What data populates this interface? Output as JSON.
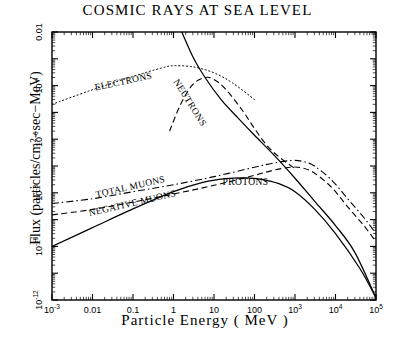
{
  "chart_data": {
    "type": "line",
    "title": "COSMIC  RAYS  AT  SEA  LEVEL",
    "xlabel": "Particle   Energy   ( MeV )",
    "ylabel": "Flux  (particles/cm²−sec−MeV)",
    "xscale": "log",
    "yscale": "log",
    "xlim": [
      0.001,
      100000
    ],
    "ylim": [
      1e-12,
      0.01
    ],
    "grid": false,
    "legend": "inline-curve-labels",
    "xticks": [
      {
        "value": 0.001,
        "label": "10",
        "sup": "-3"
      },
      {
        "value": 0.01,
        "label": "0.01",
        "sup": ""
      },
      {
        "value": 0.1,
        "label": "0.1",
        "sup": ""
      },
      {
        "value": 1,
        "label": "1",
        "sup": ""
      },
      {
        "value": 10,
        "label": "10",
        "sup": ""
      },
      {
        "value": 100,
        "label": "100",
        "sup": ""
      },
      {
        "value": 1000,
        "label": "10",
        "sup": "3"
      },
      {
        "value": 10000,
        "label": "10",
        "sup": "4"
      },
      {
        "value": 100000,
        "label": "10",
        "sup": "5"
      }
    ],
    "yticks": [
      {
        "value": 0.01,
        "label": "0.01",
        "sup": ""
      },
      {
        "value": 0.0001,
        "label": "10",
        "sup": "-4"
      },
      {
        "value": 1e-06,
        "label": "10",
        "sup": "-6"
      },
      {
        "value": 1e-08,
        "label": "10",
        "sup": "-8"
      },
      {
        "value": 1e-10,
        "label": "10",
        "sup": "-10"
      },
      {
        "value": 1e-12,
        "label": "10",
        "sup": "-12"
      }
    ],
    "series": [
      {
        "name": "ELECTRONS",
        "style": "dotted",
        "label": "ELECTRONS",
        "label_x": 0.06,
        "label_y": 0.00011,
        "label_rotate": -12,
        "points": [
          [
            0.001,
            2e-05
          ],
          [
            0.01,
            7e-05
          ],
          [
            0.1,
            0.00022
          ],
          [
            0.5,
            0.00045
          ],
          [
            1.0,
            0.00055
          ],
          [
            3.0,
            0.0005
          ],
          [
            10,
            0.0003
          ],
          [
            30,
            0.00012
          ],
          [
            100,
            3e-05
          ]
        ]
      },
      {
        "name": "NEUTRONS",
        "style": "dashed",
        "label": "NEUTRONS",
        "label_x": 2.2,
        "label_y": 2e-05,
        "label_rotate": 58,
        "points": [
          [
            0.8,
            2e-06
          ],
          [
            1.5,
            2e-05
          ],
          [
            3.0,
            0.00011
          ],
          [
            6.0,
            0.0002
          ],
          [
            10,
            0.00017
          ],
          [
            20,
            7e-05
          ],
          [
            50,
            1.2e-05
          ],
          [
            100,
            2.5e-06
          ],
          [
            200,
            6e-07
          ],
          [
            400,
            2.2e-07
          ],
          [
            1000,
            8e-08
          ]
        ]
      },
      {
        "name": "TOTAL MUONS",
        "style": "dash-dot",
        "label": "TOTAL MUONS",
        "label_x": 0.09,
        "label_y": 1.3e-08,
        "label_rotate": -13,
        "points": [
          [
            0.001,
            4e-09
          ],
          [
            0.01,
            6e-09
          ],
          [
            0.1,
            1.1e-08
          ],
          [
            1,
            2e-08
          ],
          [
            10,
            4e-08
          ],
          [
            100,
            9e-08
          ],
          [
            300,
            1.3e-07
          ],
          [
            800,
            1.6e-07
          ],
          [
            1500,
            1.5e-07
          ],
          [
            3000,
            1e-07
          ],
          [
            8000,
            3e-08
          ],
          [
            20000,
            6e-09
          ],
          [
            50000,
            1.2e-09
          ],
          [
            100000,
            3e-10
          ]
        ]
      },
      {
        "name": "NEGATIVE MUONS",
        "style": "dashed",
        "label": "NEGATIVE MUONS",
        "label_x": 0.1,
        "label_y": 3.2e-09,
        "label_rotate": -13,
        "points": [
          [
            0.001,
            1.5e-09
          ],
          [
            0.01,
            2.4e-09
          ],
          [
            0.1,
            4.5e-09
          ],
          [
            1,
            9e-09
          ],
          [
            10,
            1.9e-08
          ],
          [
            100,
            4.5e-08
          ],
          [
            300,
            7e-08
          ],
          [
            800,
            9e-08
          ],
          [
            1500,
            8.5e-08
          ],
          [
            3000,
            5.5e-08
          ],
          [
            8000,
            1.6e-08
          ],
          [
            20000,
            3e-09
          ],
          [
            50000,
            6e-10
          ],
          [
            100000,
            1.5e-10
          ]
        ]
      },
      {
        "name": "PROTONS",
        "style": "solid",
        "label": "PROTONS",
        "label_x": 60,
        "label_y": 2e-08,
        "label_rotate": 0,
        "points": [
          [
            0.001,
            1e-10
          ],
          [
            0.01,
            5e-10
          ],
          [
            0.1,
            2.5e-09
          ],
          [
            1,
            1.1e-08
          ],
          [
            5,
            2.4e-08
          ],
          [
            20,
            3.4e-08
          ],
          [
            60,
            3.6e-08
          ],
          [
            150,
            3.2e-08
          ],
          [
            400,
            2.2e-08
          ],
          [
            1000,
            1.1e-08
          ],
          [
            3000,
            2.5e-09
          ],
          [
            10000,
            3e-10
          ],
          [
            40000,
            1.5e-11
          ],
          [
            100000,
            1.2e-12
          ]
        ]
      },
      {
        "name": "PRIMARY-SPECTRUM",
        "style": "solid",
        "label": "",
        "label_x": 0,
        "label_y": 0,
        "label_rotate": 0,
        "points": [
          [
            1.6,
            0.01
          ],
          [
            3,
            0.0012
          ],
          [
            6,
            0.0002
          ],
          [
            15,
            3e-05
          ],
          [
            40,
            6e-06
          ],
          [
            100,
            1.4e-06
          ],
          [
            300,
            2.6e-07
          ],
          [
            1000,
            3.5e-08
          ],
          [
            3000,
            5e-09
          ],
          [
            10000,
            6e-10
          ],
          [
            30000,
            6e-11
          ],
          [
            100000,
            1.2e-12
          ]
        ]
      }
    ]
  }
}
